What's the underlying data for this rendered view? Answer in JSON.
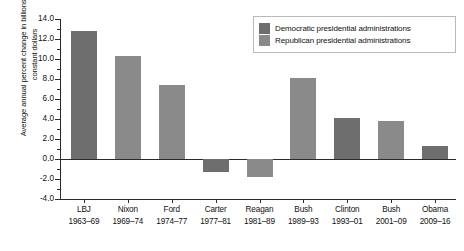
{
  "chart_data": {
    "type": "bar",
    "title": "",
    "xlabel": "",
    "ylabel": "Average annual percent change in billions of 2005 constant dollars",
    "ylim": [
      -4.0,
      14.0
    ],
    "ytick_step": 2.0,
    "ytick_labels": [
      "14.0",
      "12.0",
      "10.0",
      "8.0",
      "6.0",
      "4.0",
      "2.0",
      "0.0",
      "-2.0",
      "-4.0"
    ],
    "ytick_values": [
      14.0,
      12.0,
      10.0,
      8.0,
      6.0,
      4.0,
      2.0,
      0.0,
      -2.0,
      -4.0
    ],
    "grid": false,
    "zero_line": 0.0,
    "legend_position": "top-right",
    "categories": [
      "LBJ",
      "Nixon",
      "Ford",
      "Carter",
      "Reagan",
      "Bush",
      "Clinton",
      "Bush",
      "Obama"
    ],
    "category_years": [
      "1963–69",
      "1969–74",
      "1974–77",
      "1977–81",
      "1981–89",
      "1989–93",
      "1993–01",
      "2001–09",
      "2009–16"
    ],
    "values": [
      12.8,
      10.3,
      7.4,
      -1.3,
      -1.8,
      8.1,
      4.1,
      3.8,
      1.3
    ],
    "party": [
      "Democratic",
      "Republican",
      "Republican",
      "Democratic",
      "Republican",
      "Republican",
      "Democratic",
      "Republican",
      "Democratic"
    ],
    "bars": [
      {
        "name": "LBJ",
        "years": "1963–69",
        "value": 12.8,
        "party": "Democratic"
      },
      {
        "name": "Nixon",
        "years": "1969–74",
        "value": 10.3,
        "party": "Republican"
      },
      {
        "name": "Ford",
        "years": "1974–77",
        "value": 7.4,
        "party": "Republican"
      },
      {
        "name": "Carter",
        "years": "1977–81",
        "value": -1.3,
        "party": "Democratic"
      },
      {
        "name": "Reagan",
        "years": "1981–89",
        "value": -1.8,
        "party": "Republican"
      },
      {
        "name": "Bush",
        "years": "1989–93",
        "value": 8.1,
        "party": "Republican"
      },
      {
        "name": "Clinton",
        "years": "1993–01",
        "value": 4.1,
        "party": "Democratic"
      },
      {
        "name": "Bush",
        "years": "2001–09",
        "value": 3.8,
        "party": "Republican"
      },
      {
        "name": "Obama",
        "years": "2009–16",
        "value": 1.3,
        "party": "Democratic"
      }
    ],
    "legend": [
      {
        "label": "Democratic presidential administrations",
        "color": "#6e6e6e"
      },
      {
        "label": "Republican presidential administrations",
        "color": "#8a8a8a"
      }
    ],
    "colors": {
      "democratic": "#6e6e6e",
      "republican": "#8a8a8a",
      "axis": "#2b2b2b",
      "text": "#111111",
      "legend_border": "#b9b9b9",
      "background": "#ffffff"
    }
  }
}
